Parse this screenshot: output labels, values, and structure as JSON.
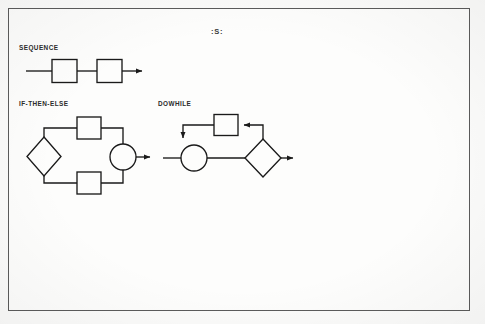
{
  "page": {
    "background_color": "#f3f3f1",
    "sheet_color": "#fbfbfa",
    "frame_color": "#5b5b5b",
    "ink_color": "#1a1a1a"
  },
  "figure": {
    "caption": ":S:"
  },
  "diagrams": [
    {
      "id": "sequence",
      "label": "SEQUENCE",
      "shapes": [
        "process-box",
        "process-box"
      ],
      "flow": "entry-line, box, link-line, box, exit-arrow"
    },
    {
      "id": "if-then-else",
      "label": "IF-THEN-ELSE",
      "shapes": [
        "decision-diamond",
        "process-box",
        "process-box",
        "junction-circle"
      ],
      "flow": "diamond splits to upper branch box and lower branch box, both converge at junction circle, exit-arrow"
    },
    {
      "id": "dowhile",
      "label": "DOWHILE",
      "shapes": [
        "junction-circle",
        "decision-diamond",
        "process-box"
      ],
      "flow": "entry-line, junction circle, link-line, decision diamond, exit-arrow; feedback loop from diamond top up and left into process box, then left and down into junction circle top"
    }
  ]
}
